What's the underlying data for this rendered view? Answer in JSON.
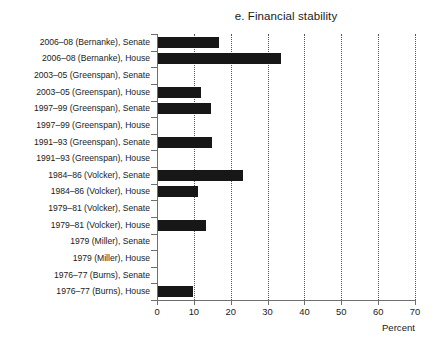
{
  "chart_data": {
    "type": "bar",
    "orientation": "horizontal",
    "title": "e. Financial stability",
    "xlabel": "Percent",
    "ylabel": "",
    "xlim": [
      0,
      70
    ],
    "xticks": [
      0,
      10,
      20,
      30,
      40,
      50,
      60,
      70
    ],
    "xtick_labels": [
      "0",
      "10",
      "20",
      "30",
      "40",
      "50",
      "60",
      "70"
    ],
    "grid": "vertical-dotted",
    "legend": "none",
    "bar_color": "#171717",
    "categories": [
      "2006–08 (Bernanke), Senate",
      "2006–08 (Bernanke), House",
      "2003–05 (Greenspan), Senate",
      "2003–05 (Greenspan), House",
      "1997–99 (Greenspan), Senate",
      "1997–99 (Greenspan), House",
      "1991–93 (Greenspan), Senate",
      "1991–93 (Greenspan), House",
      "1984–86 (Volcker), Senate",
      "1984–86 (Volcker), House",
      "1979–81 (Volcker), Senate",
      "1979–81 (Volcker), House",
      "1979 (Miller), Senate",
      "1979 (Miller), House",
      "1976–77 (Burns), Senate",
      "1976–77 (Burns), House"
    ],
    "values": [
      16.7,
      33.6,
      0,
      11.9,
      14.7,
      0,
      14.8,
      0,
      23.3,
      11.1,
      0,
      13.3,
      0,
      0,
      0,
      9.8
    ]
  }
}
